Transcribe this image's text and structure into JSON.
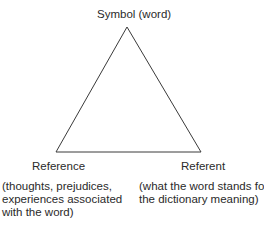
{
  "diagram": {
    "nodes": {
      "top": {
        "label": "Symbol (word)"
      },
      "left": {
        "label": "Reference",
        "description": [
          "(thoughts, prejudices,",
          "experiences associated",
          "with the word)"
        ]
      },
      "right": {
        "label": "Referent",
        "description": [
          "(what the word stands for,",
          "the dictionary meaning)"
        ]
      }
    },
    "edges": [
      {
        "from": "top",
        "to": "left"
      },
      {
        "from": "top",
        "to": "right"
      },
      {
        "from": "left",
        "to": "right"
      }
    ],
    "colors": {
      "line": "#3a3a3a",
      "text": "#2a2a2a",
      "background": "#ffffff"
    }
  }
}
